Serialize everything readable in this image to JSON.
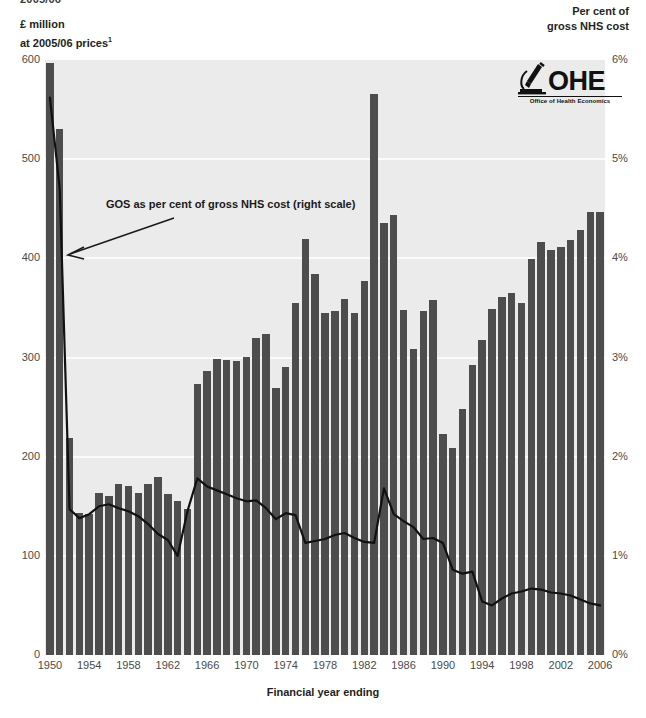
{
  "title_fragment": "2005/06",
  "left_axis": {
    "title_line1": "£ million",
    "title_line2": "at 2005/06 prices",
    "footnote_marker": "1",
    "ticks": [
      "600",
      "500",
      "400",
      "300",
      "200",
      "100",
      "0"
    ]
  },
  "right_axis": {
    "title_line1": "Per cent of",
    "title_line2": "gross NHS cost",
    "ticks": [
      "6%",
      "5%",
      "4%",
      "3%",
      "2%",
      "1%",
      "0%"
    ]
  },
  "x_axis": {
    "title": "Financial year ending",
    "ticks": [
      "1950",
      "1954",
      "1958",
      "1962",
      "1966",
      "1970",
      "1974",
      "1978",
      "1982",
      "1986",
      "1990",
      "1994",
      "1998",
      "2002",
      "2006"
    ]
  },
  "annotation": {
    "text": "GOS as per cent of gross NHS cost (right scale)"
  },
  "logo": {
    "acronym": "OHE",
    "subtitle": "Office of Health Economics",
    "icon": "microscope-icon"
  },
  "colors": {
    "bar": "#4d4d4d",
    "plot_background": "#ebebeb",
    "gridline": "#fbfbfb",
    "line": "#111111",
    "text": "#231f20"
  },
  "chart_data": {
    "type": "bar",
    "title": "",
    "xlabel": "Financial year ending",
    "ylabel": "£ million at 2005/06 prices",
    "y2label": "Per cent of gross NHS cost",
    "ylim": [
      0,
      600
    ],
    "y2lim": [
      0,
      6
    ],
    "grid": true,
    "legend": "annotation",
    "categories": [
      "1950",
      "1951",
      "1952",
      "1953",
      "1954",
      "1955",
      "1956",
      "1957",
      "1958",
      "1959",
      "1960",
      "1961",
      "1962",
      "1963",
      "1964",
      "1965",
      "1966",
      "1967",
      "1968",
      "1969",
      "1970",
      "1971",
      "1972",
      "1973",
      "1974",
      "1975",
      "1976",
      "1977",
      "1978",
      "1979",
      "1980",
      "1981",
      "1982",
      "1983",
      "1984",
      "1985",
      "1986",
      "1987",
      "1988",
      "1989",
      "1990",
      "1991",
      "1992",
      "1993",
      "1994",
      "1995",
      "1996",
      "1997",
      "1998",
      "1999",
      "2000",
      "2001",
      "2002",
      "2003",
      "2004",
      "2005",
      "2006"
    ],
    "series": [
      {
        "name": "GOS expenditure",
        "type": "bar",
        "axis": "left",
        "unit": "£ million at 2005/06 prices",
        "values": [
          597,
          530,
          219,
          143,
          142,
          163,
          160,
          172,
          170,
          163,
          172,
          180,
          162,
          155,
          147,
          273,
          286,
          298,
          297,
          296,
          301,
          320,
          324,
          269,
          290,
          355,
          420,
          384,
          345,
          347,
          359,
          345,
          377,
          566,
          436,
          444,
          348,
          309,
          347,
          358,
          223,
          209,
          248,
          292,
          318,
          349,
          361,
          365,
          355,
          399,
          416,
          408,
          411,
          418,
          429,
          447,
          447
        ]
      },
      {
        "name": "GOS as per cent of gross NHS cost",
        "type": "line",
        "axis": "right",
        "unit": "%",
        "values": [
          5.62,
          4.7,
          1.47,
          1.38,
          1.42,
          1.5,
          1.52,
          1.48,
          1.45,
          1.4,
          1.32,
          1.22,
          1.16,
          1.0,
          1.45,
          1.78,
          1.7,
          1.66,
          1.62,
          1.58,
          1.55,
          1.56,
          1.48,
          1.37,
          1.43,
          1.41,
          1.13,
          1.15,
          1.17,
          1.21,
          1.23,
          1.18,
          1.14,
          1.13,
          1.68,
          1.42,
          1.35,
          1.29,
          1.17,
          1.18,
          1.13,
          0.86,
          0.82,
          0.84,
          0.54,
          0.5,
          0.57,
          0.62,
          0.64,
          0.67,
          0.66,
          0.63,
          0.62,
          0.6,
          0.56,
          0.52,
          0.5
        ]
      }
    ]
  }
}
